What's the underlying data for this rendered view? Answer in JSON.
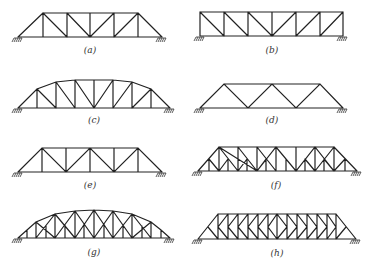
{
  "figure": {
    "panels": [
      {
        "id": "a",
        "label": "(a)",
        "type": "Pratt (inclined end posts)"
      },
      {
        "id": "b",
        "label": "(b)",
        "type": "Pratt (vertical ends)"
      },
      {
        "id": "c",
        "label": "(c)",
        "type": "Parker / curved chord Pratt"
      },
      {
        "id": "d",
        "label": "(d)",
        "type": "Warren"
      },
      {
        "id": "e",
        "label": "(e)",
        "type": "Warren with verticals"
      },
      {
        "id": "f",
        "label": "(f)",
        "type": "Subdivided Warren / Baltimore"
      },
      {
        "id": "g",
        "label": "(g)",
        "type": "Subdivided curved chord (Pennsylvania)"
      },
      {
        "id": "h",
        "label": "(h)",
        "type": "K-truss"
      }
    ],
    "line_color": "#222222",
    "background": "#ffffff"
  }
}
